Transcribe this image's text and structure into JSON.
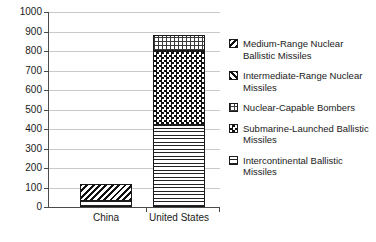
{
  "chart_data": {
    "type": "bar",
    "title": "",
    "xlabel": "",
    "ylabel": "",
    "stacked": true,
    "grid": true,
    "legend_position": "right",
    "ylim": [
      0,
      1000
    ],
    "ytick_labels": [
      "0",
      "100",
      "200",
      "300",
      "400",
      "500",
      "600",
      "700",
      "800",
      "900",
      "1000"
    ],
    "ytick_values": [
      0,
      100,
      200,
      300,
      400,
      500,
      600,
      700,
      800,
      900,
      1000
    ],
    "categories": [
      "China",
      "United States"
    ],
    "series": [
      {
        "name": "Intercontinental Ballistic Missiles",
        "pattern": "icbm",
        "values": [
          30,
          420
        ]
      },
      {
        "name": "Submarine-Launched Ballistic Missiles",
        "pattern": "submarine",
        "values": [
          0,
          380
        ]
      },
      {
        "name": "Nuclear-Capable Bombers",
        "pattern": "bombers",
        "values": [
          0,
          80
        ]
      },
      {
        "name": "Intermediate-Range Nuclear Missiles",
        "pattern": "intermediate-range",
        "values": [
          0,
          0
        ]
      },
      {
        "name": "Medium-Range Nuclear Ballistic Missiles",
        "pattern": "medium-range",
        "values": [
          90,
          0
        ]
      }
    ],
    "totals": [
      120,
      880
    ]
  },
  "legend": {
    "items": [
      {
        "label": "Medium-Range Nuclear Ballistic Missiles",
        "pattern": "medium-range"
      },
      {
        "label": "Intermediate-Range Nuclear Missiles",
        "pattern": "intermediate-range"
      },
      {
        "label": "Nuclear-Capable Bombers",
        "pattern": "bombers"
      },
      {
        "label": "Submarine-Launched Ballistic Missiles",
        "pattern": "submarine"
      },
      {
        "label": "Intercontinental Ballistic Missiles",
        "pattern": "icbm"
      }
    ]
  },
  "colors": {
    "axis": "#4a4a4a",
    "grid": "#c9c9c9",
    "ink": "#1a1a1a",
    "background": "#ffffff"
  }
}
